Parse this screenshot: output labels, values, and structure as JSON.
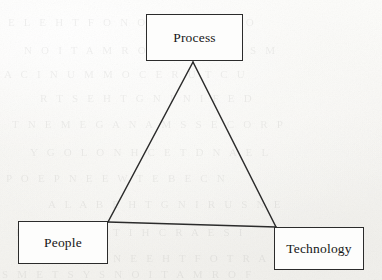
{
  "diagram": {
    "shape": "triangle",
    "stroke_color": "#2b2b2b",
    "background_color": "#fbfbf9",
    "text_color": "#161616",
    "nodes": [
      {
        "id": "process",
        "label": "Process",
        "position": "top-center",
        "box": {
          "x": 146,
          "y": 14,
          "width": 97,
          "height": 47
        }
      },
      {
        "id": "people",
        "label": "People",
        "position": "bottom-left",
        "box": {
          "x": 18,
          "y": 221,
          "width": 90,
          "height": 43
        }
      },
      {
        "id": "technology",
        "label": "Technology",
        "position": "bottom-right",
        "box": {
          "x": 274,
          "y": 227,
          "width": 90,
          "height": 43
        }
      }
    ],
    "vertices": {
      "apex": {
        "x": 193,
        "y": 62
      },
      "left": {
        "x": 108,
        "y": 222
      },
      "right": {
        "x": 276,
        "y": 227
      }
    },
    "edges": [
      {
        "id": "process-people",
        "from": "process",
        "to": "people"
      },
      {
        "id": "process-technology",
        "from": "process",
        "to": "technology"
      },
      {
        "id": "people-technology",
        "from": "people",
        "to": "technology"
      }
    ]
  },
  "artifacts": {
    "ghost_rows": [
      {
        "text": "E  L  E  H  T  F  O  N  O  I  T  A  R  E  P  O",
        "x": 8,
        "y": 16
      },
      {
        "text": "N  O  I  T  A  M  R  O  F  N  I   D  N  A   S  M",
        "x": 24,
        "y": 44
      },
      {
        "text": "A  C  I  N  U  M  M  O  C   E  R  U  T  C  U",
        "x": 4,
        "y": 68
      },
      {
        "text": "R  T  S   E  H  T   G  N  I  N  I  F  E  D",
        "x": 40,
        "y": 92
      },
      {
        "text": "T  N  E  M  E  G  A  N  A  M   S  S  E  C  O  R  P",
        "x": 12,
        "y": 118
      },
      {
        "text": "Y  G  O  L  O  N  H  C  E  T   D  N  A   E  L",
        "x": 30,
        "y": 146
      },
      {
        "text": "P  O  E  P   N  E  E  W  T  E  B   E  C  N",
        "x": 6,
        "y": 172
      },
      {
        "text": "A  L  A  B   E  H  T   G  N  I  R  U  S  N  E",
        "x": 48,
        "y": 198
      },
      {
        "text": "E  R  U  T  C  E  T  I  H  C  R  A   E  S  I",
        "x": 16,
        "y": 226
      },
      {
        "text": "R  P  R  E  T  N  E   E  H  T   F  O   T  R  A  P",
        "x": 34,
        "y": 252
      },
      {
        "text": "S  M  E  T  S  Y  S   N  O  I  T  A  M  R  O  F",
        "x": 2,
        "y": 268
      }
    ]
  }
}
